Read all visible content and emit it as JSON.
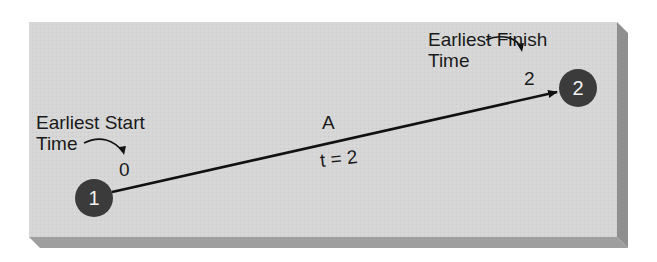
{
  "diagram": {
    "type": "activity-on-arrow network fragment",
    "colors": {
      "panel_face": "#d6d6d6",
      "panel_right_side": "#8f8f8f",
      "panel_bottom_side": "#9e9e9e",
      "node_fill": "#3b3b3b",
      "node_text": "#f2f2f2",
      "line": "#111111"
    },
    "nodes": [
      {
        "id": "1",
        "label": "1"
      },
      {
        "id": "2",
        "label": "2"
      }
    ],
    "activity": {
      "name": "A",
      "duration_label": "t = 2",
      "from": "1",
      "to": "2"
    },
    "annotations": {
      "earliest_start": {
        "line1": "Earliest Start",
        "line2": "Time",
        "value": "0"
      },
      "earliest_finish": {
        "line1": "Earliest Finish",
        "line2": "Time",
        "value": "2"
      }
    }
  }
}
